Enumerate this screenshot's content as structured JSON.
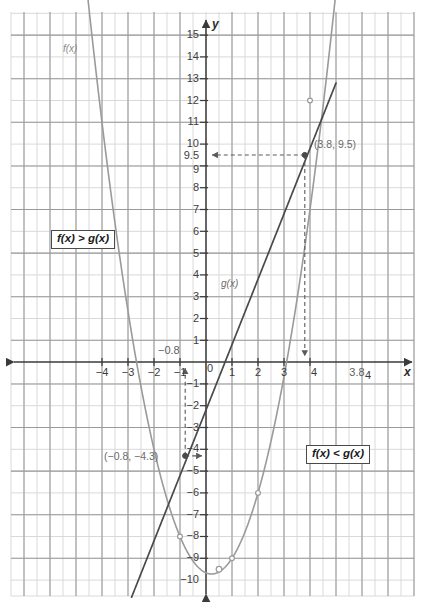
{
  "figure": {
    "type": "line",
    "axis_labels": {
      "x": "x",
      "y": "y"
    },
    "curve_labels": {
      "f": "f(x)",
      "g": "g(x)"
    },
    "annotations": {
      "region_above": "f(x) > g(x)",
      "region_below": "f(x) < g(x)",
      "point_right": "(3.8, 9.5)",
      "point_left": "(−0.8, −4.3)",
      "dash_x_left": "−0.8",
      "dash_x_right": "3.8",
      "dash_y_right": "9.5"
    },
    "colors": {
      "grid_minor": "#d9d9d9",
      "grid_major": "#8f8f8f",
      "axis": "#3a3a3a",
      "parabola": "#9a9a9a",
      "line": "#4a4a4a",
      "dashed": "#5a5a5a",
      "marker": "#9a9a9a",
      "box_border": "#4a4a4a",
      "text": "#3d3d3d"
    }
  },
  "chart_data": {
    "type": "line",
    "title": "",
    "xlabel": "x",
    "ylabel": "y",
    "xlim": [
      -4.9,
      4.9
    ],
    "ylim": [
      -10.6,
      15.6
    ],
    "grid": true,
    "legend": "inline-curve-labels",
    "x_ticks": [
      -4,
      -3,
      -2,
      -1,
      0,
      1,
      2,
      3,
      4
    ],
    "x_tick_labels": [
      "−4",
      "−3",
      "−2",
      "−1",
      "0",
      "1",
      "2",
      "3",
      "4"
    ],
    "y_ticks": [
      -10,
      -9,
      -8,
      -7,
      -6,
      -5,
      -4,
      -3,
      -2,
      -1,
      1,
      2,
      3,
      4,
      5,
      6,
      7,
      8,
      9,
      10,
      11,
      12,
      13,
      14,
      15
    ],
    "y_tick_labels": [
      "−10",
      "−9",
      "−8",
      "−7",
      "−6",
      "−5",
      "−4",
      "−3",
      "−2",
      "−1",
      "1",
      "2",
      "3",
      "4",
      "5",
      "6",
      "7",
      "8",
      "9",
      "10",
      "11",
      "12",
      "13",
      "14",
      "15"
    ],
    "extra_y_tick": {
      "value": 9.5,
      "label": "9.5"
    },
    "extra_x_tick": {
      "value": 3.8,
      "label": "3.8"
    },
    "series": [
      {
        "name": "f(x)",
        "kind": "parabola",
        "equation": "f(x) = 2x^2 - 2x - 9",
        "color": "#9a9a9a",
        "marked_points": [
          [
            -1,
            -8
          ],
          [
            1,
            -9
          ],
          [
            2,
            -6
          ],
          [
            4,
            12
          ]
        ],
        "vertex": [
          0.5,
          -9.5
        ]
      },
      {
        "name": "g(x)",
        "kind": "line",
        "equation": "g(x) = 3x - 2.2",
        "color": "#4a4a4a",
        "slope": 3,
        "intercept": -2.2
      }
    ],
    "intersections": [
      {
        "x": -0.8,
        "y": -4.3,
        "label": "(−0.8, −4.3)"
      },
      {
        "x": 3.8,
        "y": 9.5,
        "label": "(3.8, 9.5)"
      }
    ],
    "regions": [
      {
        "label": "f(x) > g(x)",
        "description": "left of x = -0.8 and right of x = 3.8"
      },
      {
        "label": "f(x) < g(x)",
        "description": "between x = -0.8 and x = 3.8"
      }
    ]
  }
}
